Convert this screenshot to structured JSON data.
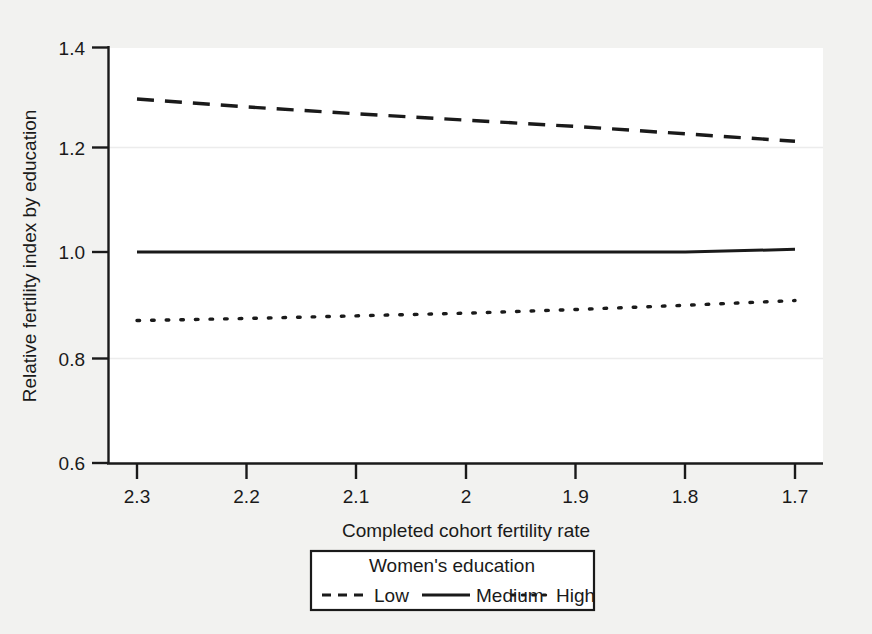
{
  "chart_data": {
    "type": "line",
    "title": "",
    "xlabel": "Completed cohort fertility rate",
    "ylabel": "Relative fertility index by education",
    "xlim": [
      2.3,
      1.7
    ],
    "ylim": [
      0.6,
      1.4
    ],
    "x_ticks": [
      "2.3",
      "2.2",
      "2.1",
      "2",
      "1.9",
      "1.8",
      "1.7"
    ],
    "x_tick_values": [
      2.3,
      2.2,
      2.1,
      2.0,
      1.9,
      1.8,
      1.7
    ],
    "y_ticks": [
      "1.4",
      "1.2",
      "1.0",
      "0.8",
      "0.6"
    ],
    "y_tick_values": [
      1.4,
      1.2,
      1.0,
      0.8,
      0.6
    ],
    "x_axis_reversed": true,
    "grid": "horizontal-faint",
    "legend_position": "bottom-center",
    "legend_title": "Women's education",
    "x": [
      2.3,
      2.2,
      2.1,
      2.0,
      1.9,
      1.8,
      1.7
    ],
    "series": [
      {
        "name": "Low",
        "style": "dashed",
        "color": "#1a1a1a",
        "values": [
          1.29,
          1.275,
          1.262,
          1.25,
          1.238,
          1.224,
          1.21
        ]
      },
      {
        "name": "Medium",
        "style": "solid",
        "color": "#1a1a1a",
        "values": [
          1.0,
          1.0,
          1.0,
          1.0,
          1.0,
          1.0,
          1.005
        ]
      },
      {
        "name": "High",
        "style": "dotted",
        "color": "#1a1a1a",
        "values": [
          0.87,
          0.874,
          0.879,
          0.884,
          0.891,
          0.899,
          0.908
        ]
      }
    ]
  },
  "axes": {
    "y_title": "Relative fertility index by education",
    "x_title": "Completed cohort fertility rate",
    "y_tick_labels": [
      "1.4",
      "1.2",
      "1.0",
      "0.8",
      "0.6"
    ],
    "x_tick_labels": [
      "2.3",
      "2.2",
      "2.1",
      "2",
      "1.9",
      "1.8",
      "1.7"
    ]
  },
  "legend": {
    "title": "Women's education",
    "entries": [
      {
        "label": "Low",
        "style": "dashed"
      },
      {
        "label": "Medium",
        "style": "solid"
      },
      {
        "label": "High",
        "style": "dotted"
      }
    ]
  },
  "colors": {
    "background": "#f2f2f0",
    "plot_background": "#ffffff",
    "ink": "#1a1a1a",
    "grid": "#ededed"
  }
}
